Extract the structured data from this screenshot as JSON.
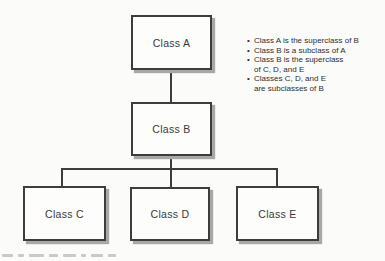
{
  "diagram": {
    "type": "class-hierarchy",
    "nodes": {
      "a": {
        "label": "Class A"
      },
      "b": {
        "label": "Class B"
      },
      "c": {
        "label": "Class C"
      },
      "d": {
        "label": "Class D"
      },
      "e": {
        "label": "Class E"
      }
    },
    "edges": [
      {
        "from": "Class A",
        "to": "Class B"
      },
      {
        "from": "Class B",
        "to": "Class C"
      },
      {
        "from": "Class B",
        "to": "Class D"
      },
      {
        "from": "Class B",
        "to": "Class E"
      }
    ],
    "colors": {
      "box_border": "#3d3d3d",
      "box_fill": "#fdfdfc",
      "shadow": "#a8a8a8",
      "connector": "#3d3d3d",
      "text": "#3a3a3a",
      "background": "#fbfbf9"
    }
  },
  "notes": {
    "bullet_char": "•",
    "items": [
      {
        "lines": [
          "Class A is the superclass of B"
        ]
      },
      {
        "lines": [
          "Class B is a subclass of A"
        ]
      },
      {
        "lines": [
          "Class B is the superclass",
          "of C, D, and E"
        ]
      },
      {
        "lines": [
          "Classes C, D, and E",
          "are subclasses of B"
        ]
      }
    ]
  }
}
